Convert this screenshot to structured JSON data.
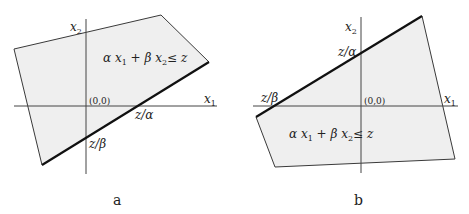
{
  "figure": {
    "panels": [
      {
        "id": "a",
        "caption": "a",
        "axis_x_label": "x",
        "axis_x_sub": "1",
        "axis_y_label": "x",
        "axis_y_sub": "2",
        "origin_label": "(0,0)",
        "x_intercept_label": "z/α",
        "y_intercept_label": "z/β",
        "inequality": {
          "a": "α x",
          "s1": "1",
          "b": " + β x",
          "s2": "2",
          "c": "≤ z"
        },
        "polygon": [
          [
            14,
            49
          ],
          [
            161,
            15
          ],
          [
            209,
            62
          ],
          [
            42,
            165
          ]
        ],
        "bound_edge": [
          [
            209,
            62
          ],
          [
            42,
            165
          ]
        ],
        "x_axis": [
          [
            14,
            106
          ],
          [
            217,
            106
          ]
        ],
        "y_axis": [
          [
            86,
            19
          ],
          [
            86,
            174
          ]
        ]
      },
      {
        "id": "b",
        "caption": "b",
        "axis_x_label": "x",
        "axis_x_sub": "1",
        "axis_y_label": "x",
        "axis_y_sub": "2",
        "origin_label": "(0,0)",
        "x_intercept_label": "z/β",
        "y_intercept_label": "z/α",
        "inequality": {
          "a": "α x",
          "s1": "1",
          "b": " + β x",
          "s2": "2",
          "c": "≤ z"
        },
        "polygon": [
          [
            256,
            117
          ],
          [
            422,
            16
          ],
          [
            455,
            159
          ],
          [
            275,
            167
          ]
        ],
        "bound_edge": [
          [
            256,
            117
          ],
          [
            422,
            16
          ]
        ],
        "x_axis": [
          [
            253,
            106
          ],
          [
            458,
            106
          ]
        ],
        "y_axis": [
          [
            361,
            17
          ],
          [
            361,
            173
          ]
        ]
      }
    ],
    "colors": {
      "fill": "#efefef",
      "edge": "#3a3a3a",
      "bound": "#111111",
      "axis": "#444444"
    }
  }
}
